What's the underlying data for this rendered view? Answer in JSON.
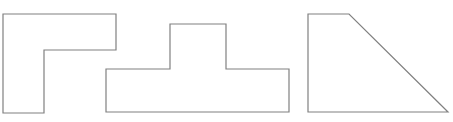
{
  "diagram": {
    "background": "#ffffff",
    "stroke_color": "#808080",
    "shapes": [
      {
        "name": "l-shape",
        "points": "3,14 116,14 116,50 44,50 44,113 3,113"
      },
      {
        "name": "t-shape",
        "points": "106,69 170,69 170,24 226,24 226,69 289,69 289,112 106,112"
      },
      {
        "name": "trapezoid-shape",
        "points": "308,14 349,14 448,112 308,112"
      }
    ]
  }
}
